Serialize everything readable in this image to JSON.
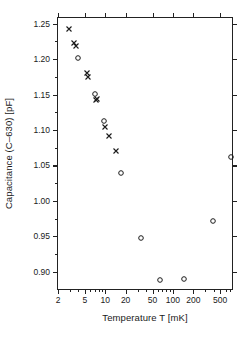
{
  "chart_data": {
    "type": "scatter",
    "title": "",
    "xlabel": "Temperature T [mK]",
    "ylabel": "Capacitance (C–630) [pF]",
    "xscale": "log",
    "yscale": "linear",
    "xlim": [
      2,
      800
    ],
    "ylim": [
      0.873,
      1.258
    ],
    "grid": false,
    "legend": "none",
    "xticks": [
      {
        "value": 2,
        "label": "2"
      },
      {
        "value": 5,
        "label": "5"
      },
      {
        "value": 10,
        "label": "10"
      },
      {
        "value": 20,
        "label": "20"
      },
      {
        "value": 50,
        "label": "50"
      },
      {
        "value": 100,
        "label": "100"
      },
      {
        "value": 200,
        "label": "200"
      },
      {
        "value": 500,
        "label": "500"
      }
    ],
    "xminorticks": [
      3,
      4,
      6,
      7,
      8,
      9,
      30,
      40,
      60,
      70,
      80,
      90,
      300,
      400,
      600,
      700
    ],
    "yticks": [
      {
        "value": 0.9,
        "label": "0.90"
      },
      {
        "value": 0.95,
        "label": "0.95"
      },
      {
        "value": 1.0,
        "label": "1.00"
      },
      {
        "value": 1.05,
        "label": "1.05"
      },
      {
        "value": 1.1,
        "label": "1.10"
      },
      {
        "value": 1.15,
        "label": "1.15"
      },
      {
        "value": 1.2,
        "label": "1.20"
      },
      {
        "value": 1.25,
        "label": "1.25"
      }
    ],
    "series": [
      {
        "name": "cooling (cross)",
        "marker": "cross",
        "color": "#1a1a1a",
        "points": [
          {
            "x": 2.9,
            "y": 1.243
          },
          {
            "x": 3.5,
            "y": 1.223
          },
          {
            "x": 3.7,
            "y": 1.219
          },
          {
            "x": 5.3,
            "y": 1.18
          },
          {
            "x": 5.6,
            "y": 1.175
          },
          {
            "x": 7.3,
            "y": 1.143
          },
          {
            "x": 7.6,
            "y": 1.144
          },
          {
            "x": 10.0,
            "y": 1.104
          },
          {
            "x": 11.2,
            "y": 1.092
          },
          {
            "x": 14.5,
            "y": 1.071
          }
        ]
      },
      {
        "name": "warming (circle)",
        "marker": "circle",
        "color": "#1a1a1a",
        "points": [
          {
            "x": 4.0,
            "y": 1.202
          },
          {
            "x": 7.0,
            "y": 1.151
          },
          {
            "x": 9.5,
            "y": 1.113
          },
          {
            "x": 17.0,
            "y": 1.04
          },
          {
            "x": 34.0,
            "y": 0.948
          },
          {
            "x": 65.0,
            "y": 0.888
          },
          {
            "x": 145.0,
            "y": 0.89
          },
          {
            "x": 390.0,
            "y": 0.972
          },
          {
            "x": 720.0,
            "y": 1.062
          }
        ]
      }
    ]
  }
}
